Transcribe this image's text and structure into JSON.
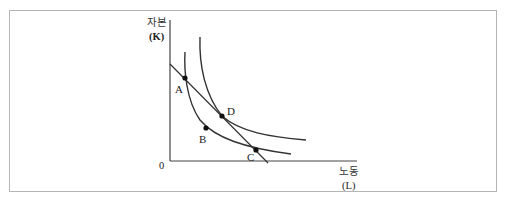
{
  "diagram": {
    "type": "isoquant-isocost",
    "y_axis": {
      "label": "자본",
      "unit": "(K)"
    },
    "x_axis": {
      "label": "노동",
      "unit": "(L)"
    },
    "origin_label": "0",
    "points": [
      {
        "id": "A",
        "label": "A",
        "x": 185,
        "y": 78
      },
      {
        "id": "B",
        "label": "B",
        "x": 206,
        "y": 128
      },
      {
        "id": "C",
        "label": "C",
        "x": 256,
        "y": 150
      },
      {
        "id": "D",
        "label": "D",
        "x": 222,
        "y": 116
      }
    ],
    "curves": [
      {
        "name": "inner-isoquant",
        "passes_through": [
          "A",
          "B",
          "C"
        ]
      },
      {
        "name": "outer-isoquant",
        "passes_through": [
          "D"
        ]
      },
      {
        "name": "isocost-line",
        "passes_through": [
          "A",
          "D",
          "C"
        ]
      }
    ],
    "colors": {
      "line": "#333333",
      "frame": "#b5b5b5"
    }
  }
}
